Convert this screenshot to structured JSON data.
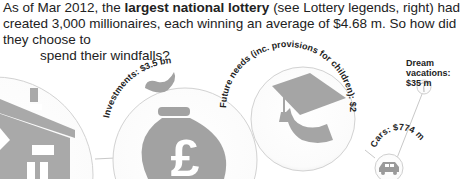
{
  "intro": {
    "part1": "As of Mar 2012, the ",
    "bold": "largest national lottery",
    "part2": " (see Lottery legends, right) had created 3,000 millionaires, each winning an average of $4.68 m. So how did they choose to",
    "line3": "spend their windfalls?"
  },
  "categories": [
    {
      "name": "Housing",
      "icon": "house-icon",
      "label": ""
    },
    {
      "name": "Investments",
      "icon": "money-bag-pound-icon",
      "label": "Investments: $3.5 bn"
    },
    {
      "name": "Future needs",
      "icon": "graduation-cap-icon",
      "label": "Future needs (inc. provisions for children): $2.67 bn"
    },
    {
      "name": "Cars",
      "icon": "car-icon",
      "label": "Cars: $774 m"
    },
    {
      "name": "Dream vacations",
      "icon": "palm-tree-icon",
      "label_line1": "Dream vacations:",
      "label_line2": "$35 m"
    }
  ],
  "colors": {
    "icon_gray": "#a9a9a9",
    "circle_stroke": "#d0d0d0",
    "connector": "#c8c8c8"
  }
}
